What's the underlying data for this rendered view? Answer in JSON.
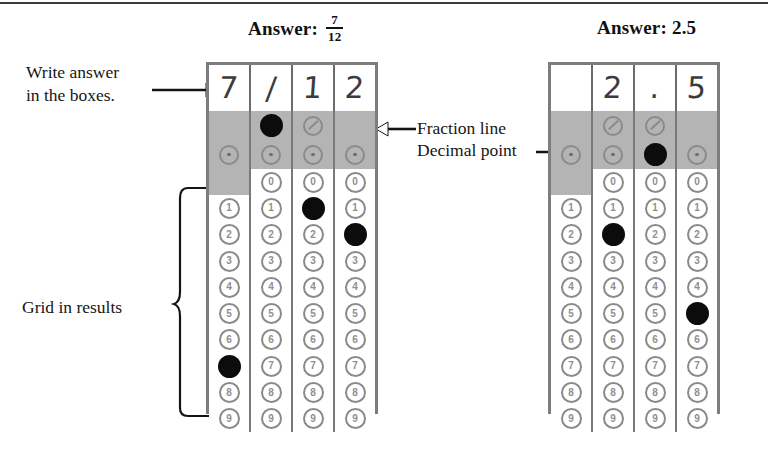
{
  "page": {
    "top_rule": true
  },
  "annotations": {
    "write_answer": "Write answer\nin the boxes.",
    "write_answer_line1": "Write answer",
    "write_answer_line2": "in the boxes.",
    "fraction_line": "Fraction line",
    "decimal_point": "Decimal point",
    "grid_in_results": "Grid in results"
  },
  "grids": [
    {
      "id": "fraction-grid",
      "heading": {
        "label": "Answer:",
        "value_type": "fraction",
        "numerator": "7",
        "denominator": "12",
        "display": "Answer: 7/12"
      },
      "written_row": [
        "7",
        "/",
        "1",
        "2"
      ],
      "fraction_row": [
        {
          "present": false,
          "filled": false,
          "glyph": ""
        },
        {
          "present": true,
          "filled": true,
          "glyph": "/"
        },
        {
          "present": true,
          "filled": false,
          "glyph": "/"
        },
        {
          "present": false,
          "filled": false,
          "glyph": ""
        }
      ],
      "decimal_row": [
        {
          "present": true,
          "filled": false,
          "glyph": "."
        },
        {
          "present": true,
          "filled": false,
          "glyph": "."
        },
        {
          "present": true,
          "filled": false,
          "glyph": "."
        },
        {
          "present": true,
          "filled": false,
          "glyph": "."
        }
      ],
      "digits": [
        "0",
        "1",
        "2",
        "3",
        "4",
        "5",
        "6",
        "7",
        "8",
        "9"
      ],
      "columns": [
        {
          "index": 1,
          "zero_present": false,
          "filled_digit": "7"
        },
        {
          "index": 2,
          "zero_present": true,
          "filled_digit": null
        },
        {
          "index": 3,
          "zero_present": true,
          "filled_digit": "1"
        },
        {
          "index": 4,
          "zero_present": true,
          "filled_digit": "2"
        }
      ]
    },
    {
      "id": "decimal-grid",
      "heading": {
        "label": "Answer:",
        "value_type": "decimal",
        "value": "2.5",
        "display": "Answer: 2.5"
      },
      "written_row": [
        "",
        "2",
        ".",
        "5"
      ],
      "fraction_row": [
        {
          "present": false,
          "filled": false,
          "glyph": ""
        },
        {
          "present": true,
          "filled": false,
          "glyph": "/"
        },
        {
          "present": true,
          "filled": false,
          "glyph": "/"
        },
        {
          "present": false,
          "filled": false,
          "glyph": ""
        }
      ],
      "decimal_row": [
        {
          "present": true,
          "filled": false,
          "glyph": "."
        },
        {
          "present": true,
          "filled": false,
          "glyph": "."
        },
        {
          "present": true,
          "filled": true,
          "glyph": "."
        },
        {
          "present": true,
          "filled": false,
          "glyph": "."
        }
      ],
      "digits": [
        "0",
        "1",
        "2",
        "3",
        "4",
        "5",
        "6",
        "7",
        "8",
        "9"
      ],
      "columns": [
        {
          "index": 1,
          "zero_present": false,
          "filled_digit": null
        },
        {
          "index": 2,
          "zero_present": true,
          "filled_digit": "2"
        },
        {
          "index": 3,
          "zero_present": true,
          "filled_digit": null
        },
        {
          "index": 4,
          "zero_present": true,
          "filled_digit": "5"
        }
      ]
    }
  ],
  "colors": {
    "ink": "#141414",
    "grid_border": "#7d7d7d",
    "band": "#b4b4b4",
    "bubble": "#8a8a8a",
    "filled": "#0c0c0c"
  }
}
